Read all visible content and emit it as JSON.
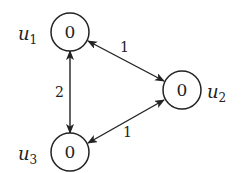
{
  "diagram": {
    "type": "graph",
    "nodes": [
      {
        "id": "u1",
        "name": "u",
        "sub": "1",
        "value": "0"
      },
      {
        "id": "u2",
        "name": "u",
        "sub": "2",
        "value": "0"
      },
      {
        "id": "u3",
        "name": "u",
        "sub": "3",
        "value": "0"
      }
    ],
    "edges": [
      {
        "from": "u1",
        "to": "u2",
        "weight": "1",
        "bidirectional": true
      },
      {
        "from": "u1",
        "to": "u3",
        "weight": "2",
        "bidirectional": true
      },
      {
        "from": "u3",
        "to": "u2",
        "weight": "1",
        "bidirectional": true
      }
    ]
  }
}
